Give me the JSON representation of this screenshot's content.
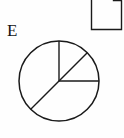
{
  "figure": {
    "caption_label": "E",
    "background_color": "#fefefe",
    "ink_color": "#1a1a1a",
    "page_icon": {
      "name": "page-fold-icon",
      "description": "document page with folded top-right corner",
      "x": 91,
      "y": -6,
      "width": 31,
      "height": 36,
      "fold_size": 8
    },
    "circle": {
      "center_x": 59,
      "center_y": 81,
      "radius": 40,
      "stroke_width": 1.4
    },
    "radii": [
      {
        "name": "radius-up",
        "angle_deg": 90,
        "label": "vertical radius to 12 o'clock"
      },
      {
        "name": "radius-upper-right",
        "angle_deg": 45,
        "label": "diagonal radius to upper right"
      },
      {
        "name": "radius-right",
        "angle_deg": 0,
        "label": "horizontal radius to 3 o'clock"
      },
      {
        "name": "radius-lower-left",
        "angle_deg": 225,
        "label": "diagonal radius to lower left"
      }
    ],
    "sectors": [
      {
        "name": "sector-top-right-upper",
        "start_deg": 45,
        "end_deg": 90,
        "sweep_deg": 45,
        "fraction": "1/8"
      },
      {
        "name": "sector-top-right-lower",
        "start_deg": 0,
        "end_deg": 45,
        "sweep_deg": 45,
        "fraction": "1/8"
      },
      {
        "name": "sector-bottom-right",
        "start_deg": 225,
        "end_deg": 360,
        "sweep_deg": 135,
        "fraction": "3/8"
      },
      {
        "name": "sector-left",
        "start_deg": 90,
        "end_deg": 225,
        "sweep_deg": 135,
        "fraction": "3/8"
      }
    ]
  }
}
